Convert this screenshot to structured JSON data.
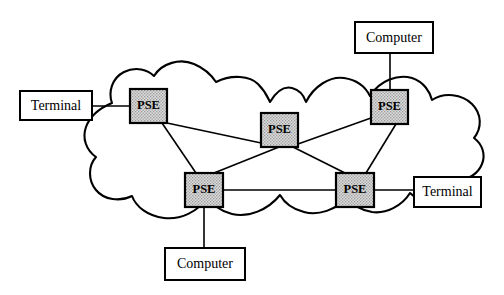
{
  "diagram": {
    "colors": {
      "stroke": "#000000",
      "background": "#ffffff",
      "pse_fill": "#d8d8d8"
    },
    "cloud": {
      "name": "network-cloud",
      "label": ""
    },
    "pse_nodes": [
      {
        "id": "pse-left",
        "label": "PSE",
        "x": 130,
        "y": 89,
        "w": 37,
        "h": 34
      },
      {
        "id": "pse-center",
        "label": "PSE",
        "x": 261,
        "y": 113,
        "w": 37,
        "h": 34
      },
      {
        "id": "pse-right-top",
        "label": "PSE",
        "x": 371,
        "y": 90,
        "w": 37,
        "h": 34
      },
      {
        "id": "pse-bottom-left",
        "label": "PSE",
        "x": 185,
        "y": 173,
        "w": 38,
        "h": 34
      },
      {
        "id": "pse-bottom-right",
        "label": "PSE",
        "x": 336,
        "y": 173,
        "w": 38,
        "h": 34
      }
    ],
    "endpoints": [
      {
        "id": "terminal-left",
        "label": "Terminal",
        "x": 20,
        "y": 91,
        "w": 72,
        "h": 29
      },
      {
        "id": "computer-top",
        "label": "Computer",
        "x": 355,
        "y": 22,
        "w": 78,
        "h": 31
      },
      {
        "id": "terminal-right",
        "label": "Terminal",
        "x": 414,
        "y": 177,
        "w": 67,
        "h": 30
      },
      {
        "id": "computer-bottom",
        "label": "Computer",
        "x": 165,
        "y": 248,
        "w": 80,
        "h": 32
      }
    ],
    "links": [
      {
        "id": "link-terminal-left-to-pse-left",
        "from": "terminal-left",
        "to": "pse-left"
      },
      {
        "id": "link-computer-top-to-pse-right-top",
        "from": "computer-top",
        "to": "pse-right-top"
      },
      {
        "id": "link-terminal-right-to-pse-bot-right",
        "from": "terminal-right",
        "to": "pse-bottom-right"
      },
      {
        "id": "link-computer-bottom-to-pse-bot-left",
        "from": "computer-bottom",
        "to": "pse-bottom-left"
      },
      {
        "id": "link-pse-left-to-pse-center",
        "from": "pse-left",
        "to": "pse-center"
      },
      {
        "id": "link-pse-left-to-pse-bottom-left",
        "from": "pse-left",
        "to": "pse-bottom-left"
      },
      {
        "id": "link-pse-center-to-pse-right-top",
        "from": "pse-center",
        "to": "pse-right-top"
      },
      {
        "id": "link-pse-center-to-pse-bottom-left",
        "from": "pse-center",
        "to": "pse-bottom-left"
      },
      {
        "id": "link-pse-center-to-pse-bottom-right",
        "from": "pse-center",
        "to": "pse-bottom-right"
      },
      {
        "id": "link-pse-right-top-to-pse-bot-right",
        "from": "pse-right-top",
        "to": "pse-bottom-right"
      },
      {
        "id": "link-pse-bot-left-to-pse-bot-right",
        "from": "pse-bottom-left",
        "to": "pse-bottom-right"
      }
    ]
  }
}
